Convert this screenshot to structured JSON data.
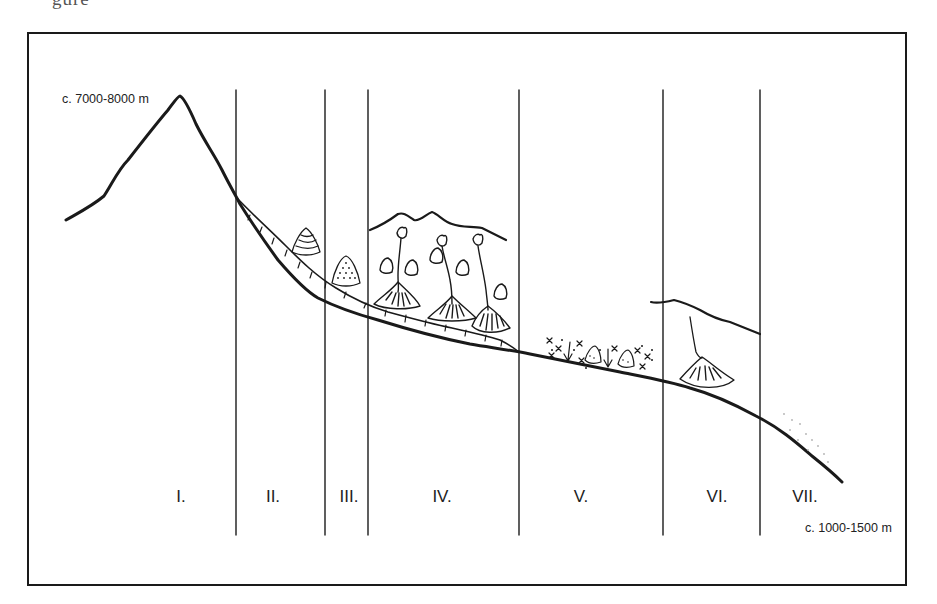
{
  "caption_fragment": "gure",
  "elevation_labels": {
    "top": "c. 7000-8000 m",
    "bottom": "c. 1000-1500 m"
  },
  "zones": [
    {
      "id": "I",
      "label": "I."
    },
    {
      "id": "II",
      "label": "II."
    },
    {
      "id": "III",
      "label": "III."
    },
    {
      "id": "IV",
      "label": "IV."
    },
    {
      "id": "V",
      "label": "V."
    },
    {
      "id": "VI",
      "label": "VI."
    },
    {
      "id": "VII",
      "label": "VII."
    }
  ],
  "diagram_elements": [
    "mountain-profile-line",
    "zone-boundary-lines",
    "glacier-tongue-with-crevasses",
    "banded-moraine-cone",
    "dotted-debris-cone",
    "tributary-valleys-with-debris-fans",
    "mixed-debris-deposit-with-arrows",
    "secondary-ridge-with-alluvial-fan",
    "stippled-outwash"
  ],
  "colors": {
    "ink": "#1a1a1a",
    "background": "#ffffff",
    "stipple": "#b0b0b0"
  }
}
